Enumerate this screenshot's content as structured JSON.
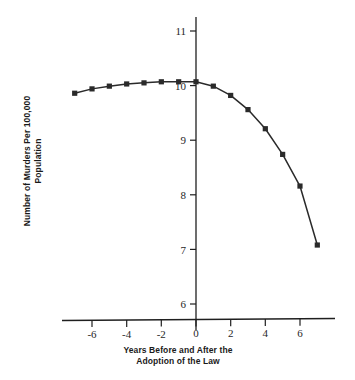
{
  "chart_data": {
    "type": "line",
    "title": "",
    "subtitle": "",
    "xlabel": "Years Before and After the Adoption of the Law",
    "ylabel": "Number of Murders Per 100,000 Population",
    "xlim": [
      -7.6,
      7.6
    ],
    "ylim": [
      6,
      11.3
    ],
    "xticks": [
      -6,
      -4,
      -2,
      0,
      2,
      4,
      6
    ],
    "xtick_labels": [
      "-6",
      "-4",
      "-2",
      "0",
      "2",
      "4",
      "6"
    ],
    "yticks": [
      6,
      7,
      8,
      9,
      10,
      11
    ],
    "ytick_labels": [
      "6",
      "7",
      "8",
      "9",
      "10",
      "11"
    ],
    "grid": false,
    "legend": false,
    "legend_position": "none",
    "marker": "square",
    "line_color": "#2a2a2a",
    "marker_color": "#2a2a2a",
    "x": [
      -7,
      -6,
      -5,
      -4,
      -3,
      -2,
      -1,
      0,
      1,
      2,
      3,
      4,
      5,
      6,
      7
    ],
    "values": [
      9.86,
      9.94,
      9.99,
      10.03,
      10.05,
      10.07,
      10.07,
      10.07,
      9.99,
      9.82,
      9.56,
      9.21,
      8.74,
      8.16,
      7.08
    ],
    "series": [
      {
        "name": "Murder rate",
        "values": [
          9.86,
          9.94,
          9.99,
          10.03,
          10.05,
          10.07,
          10.07,
          10.07,
          9.99,
          9.82,
          9.56,
          9.21,
          8.74,
          8.16,
          7.08
        ]
      }
    ]
  },
  "axes": {
    "ylabel_line1": "Number of Murders Per 100,000",
    "ylabel_line2": "Population",
    "xlabel_line1": "Years Before and After the",
    "xlabel_line2": "Adoption of the Law"
  }
}
